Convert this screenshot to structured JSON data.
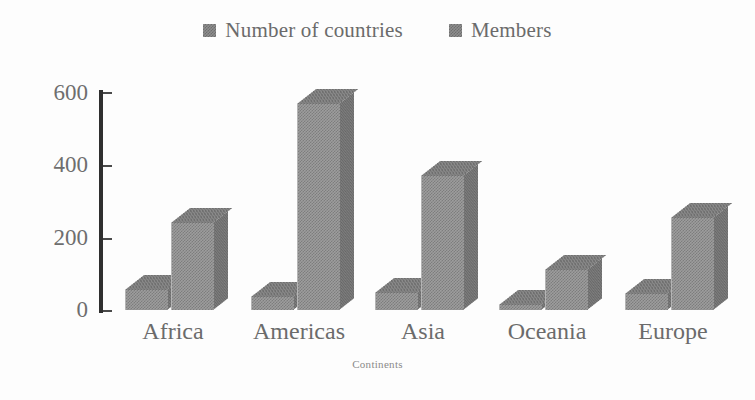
{
  "chart_data": {
    "type": "bar",
    "title": "",
    "subtitle": "",
    "xlabel": "Continents",
    "ylabel": "",
    "categories": [
      "Africa",
      "Americas",
      "Asia",
      "Oceania",
      "Europe"
    ],
    "series": [
      {
        "name": "Number of countries",
        "color": "#9d9d9d",
        "values": [
          54,
          35,
          48,
          14,
          45
        ]
      },
      {
        "name": "Members",
        "color": "#9d9d9d",
        "values": [
          240,
          570,
          370,
          110,
          255
        ]
      }
    ],
    "ylim": [
      0,
      600
    ],
    "yticks": [
      0,
      200,
      400,
      600
    ],
    "ytick_labels": [
      "0",
      "200",
      "400",
      "600"
    ],
    "grid": false,
    "legend_position": "top-center",
    "style": "3d-clustered-column-grayscale"
  },
  "legend": {
    "entries": [
      {
        "label": "Number of countries",
        "swatch": "legend-swatch-number-of-countries"
      },
      {
        "label": "Members",
        "swatch": "legend-swatch-members"
      }
    ]
  },
  "axes": {
    "x_title": "Continents",
    "y_tick_labels": [
      "600",
      "400",
      "200",
      "0"
    ],
    "category_labels": [
      "Africa",
      "Americas",
      "Asia",
      "Oceania",
      "Europe"
    ]
  }
}
